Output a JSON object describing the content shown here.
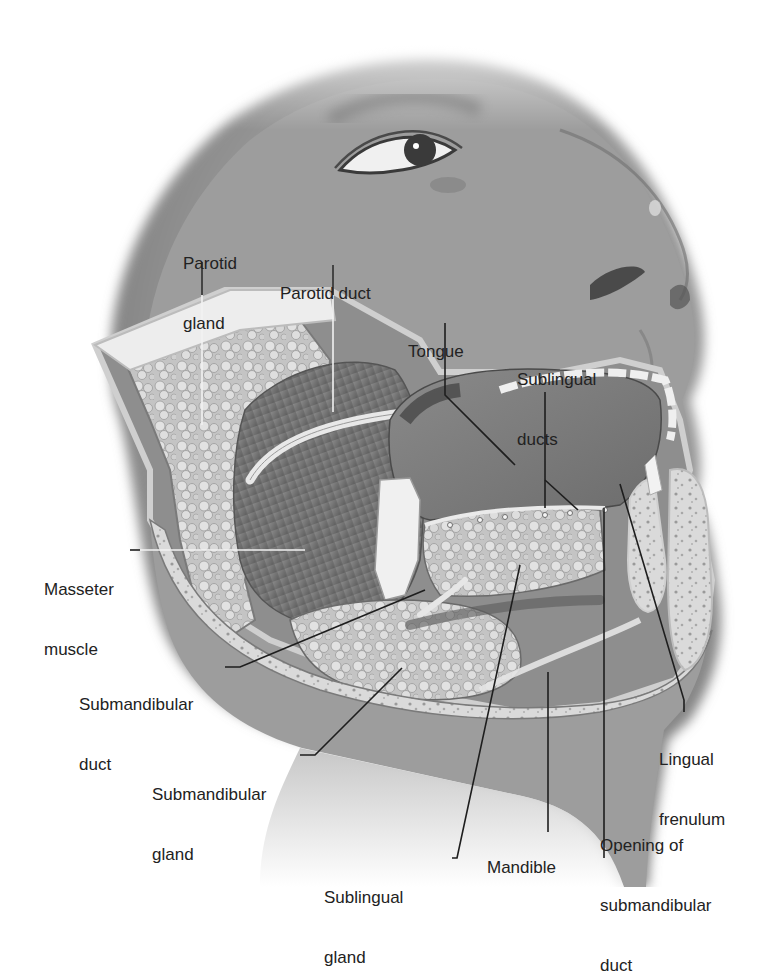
{
  "figure": {
    "style": "grayscale medical illustration",
    "colors": {
      "background": "#ffffff",
      "skin": "#9a9a9a",
      "skin_shadow": "#6e6e6e",
      "gland": "#c8c8c8",
      "gland_highlight": "#e6e6e6",
      "muscle": "#7c7c7c",
      "bone": "#dcdcdc",
      "leader_line": "#1e1e1e",
      "label_text": "#222222"
    }
  },
  "labels": [
    {
      "id": "parotid-gland",
      "line1": "Parotid",
      "line2": "gland"
    },
    {
      "id": "parotid-duct",
      "line1": "Parotid duct"
    },
    {
      "id": "tongue",
      "line1": "Tongue"
    },
    {
      "id": "sublingual-ducts",
      "line1": "Sublingual",
      "line2": "ducts"
    },
    {
      "id": "masseter-muscle",
      "line1": "Masseter",
      "line2": "muscle"
    },
    {
      "id": "submandibular-duct",
      "line1": "Submandibular",
      "line2": "duct"
    },
    {
      "id": "submandibular-gland",
      "line1": "Submandibular",
      "line2": "gland"
    },
    {
      "id": "sublingual-gland",
      "line1": "Sublingual",
      "line2": "gland"
    },
    {
      "id": "mandible",
      "line1": "Mandible"
    },
    {
      "id": "opening-submandibular-duct",
      "line1": "Opening of",
      "line2": "submandibular",
      "line3": "duct"
    },
    {
      "id": "lingual-frenulum",
      "line1": "Lingual",
      "line2": "frenulum"
    }
  ]
}
